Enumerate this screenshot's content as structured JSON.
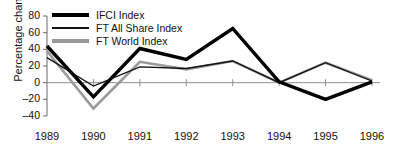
{
  "chart_data": {
    "type": "line",
    "title": "",
    "xlabel": "",
    "ylabel": "Percentage change",
    "categories": [
      "1989",
      "1990",
      "1991",
      "1992",
      "1993",
      "1994",
      "1995",
      "1996"
    ],
    "x": [
      1989,
      1990,
      1991,
      1992,
      1993,
      1994,
      1995,
      1996
    ],
    "ylim": [
      -40,
      80
    ],
    "yticks": [
      80,
      60,
      40,
      20,
      0,
      -20,
      -40
    ],
    "ytick_labels": [
      "80",
      "60",
      "40",
      "20",
      "0",
      "–20",
      "–40"
    ],
    "grid": false,
    "legend_position": "top-left",
    "series": [
      {
        "name": "IFCI Index",
        "color": "#000000",
        "width": 3.4,
        "values": [
          44,
          -17,
          41,
          28,
          65,
          1,
          -20,
          1
        ]
      },
      {
        "name": "FT All Share Index",
        "color": "#111111",
        "width": 1.3,
        "values": [
          30,
          -4,
          19,
          17,
          26,
          0,
          24,
          2
        ]
      },
      {
        "name": "FT World Index",
        "color": "#9a9a9a",
        "width": 2.6,
        "values": [
          38,
          -31,
          25,
          16,
          26,
          0,
          24,
          3
        ]
      }
    ]
  },
  "legend": {
    "items": [
      {
        "label": "IFCI Index"
      },
      {
        "label": "FT All Share Index"
      },
      {
        "label": "FT World Index"
      }
    ]
  },
  "axis": {
    "y_title": "Percentage change",
    "y_labels": [
      "80",
      "60",
      "40",
      "20",
      "0",
      "–20",
      "–40"
    ],
    "x_labels": [
      "1989",
      "1990",
      "1991",
      "1992",
      "1993",
      "1994",
      "1995",
      "1996"
    ]
  }
}
